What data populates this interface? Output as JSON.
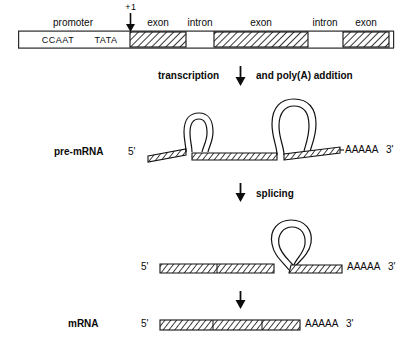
{
  "figure": {
    "background_color": "#ffffff",
    "line_color": "#000000",
    "hatch_color": "#1a1a1a"
  },
  "gene_map": {
    "start_label": "+1",
    "promoter_label": "promoter",
    "promoter_elements": [
      {
        "name": "CCAAT",
        "label": "CCAAT"
      },
      {
        "name": "TATA",
        "label": "TATA"
      }
    ],
    "segment_labels": [
      {
        "label": "exon"
      },
      {
        "label": "intron"
      },
      {
        "label": "exon"
      },
      {
        "label": "intron"
      },
      {
        "label": "exon"
      }
    ]
  },
  "steps": {
    "transcription": {
      "left_label": "transcription",
      "right_label": "and poly(A) addition",
      "arrow": "down-arrow-icon"
    },
    "splicing": {
      "label": "splicing",
      "arrow": "down-arrow-icon"
    },
    "final": {
      "arrow": "down-arrow-icon"
    }
  },
  "molecules": {
    "pre_mrna": {
      "name": "pre-mRNA",
      "five_prime": "5'",
      "poly_a": "AAAAA",
      "three_prime": "3'",
      "intron_loops": 2
    },
    "intermediate": {
      "name": "",
      "five_prime": "5'",
      "poly_a": "AAAAA",
      "three_prime": "3'",
      "intron_loops": 1
    },
    "mrna": {
      "name": "mRNA",
      "five_prime": "5'",
      "poly_a": "AAAAA",
      "three_prime": "3'",
      "intron_loops": 0
    }
  }
}
